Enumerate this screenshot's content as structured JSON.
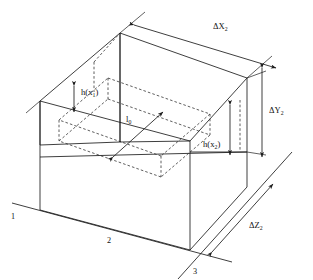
{
  "figure": {
    "type": "engineering-isometric-diagram",
    "colors": {
      "line": "#1c1c1c",
      "dashed_line": "#2a2a2a",
      "background": "#ffffff",
      "text": "#111111"
    },
    "dimension_labels": [
      {
        "id": "delta-x2",
        "base": "ΔX",
        "subscript": "2",
        "text": "ΔX₂",
        "orientation": "top-edge-horizontal-oblique",
        "arrow_style": "double-headed",
        "position": {
          "x": 224,
          "y": 28
        }
      },
      {
        "id": "delta-y2",
        "base": "ΔY",
        "subscript": "2",
        "text": "ΔY₂",
        "orientation": "right-edge-vertical",
        "arrow_style": "double-headed",
        "position": {
          "x": 277,
          "y": 110
        }
      },
      {
        "id": "delta-z2",
        "base": "ΔZ",
        "subscript": "2",
        "text": "ΔZ₂",
        "orientation": "bottom-right-edge-oblique",
        "arrow_style": "double-headed",
        "position": {
          "x": 258,
          "y": 225
        }
      }
    ],
    "height_labels": [
      {
        "id": "h-x1",
        "base": "h(x",
        "subscript": "1",
        "suffix": ")",
        "text": "h(x₁)",
        "orientation": "vertical",
        "arrow_style": "double-headed",
        "position": {
          "x": 78,
          "y": 93
        }
      },
      {
        "id": "h-x2",
        "base": "h(x",
        "subscript": "2",
        "suffix": ")",
        "text": "h(x₂)",
        "orientation": "vertical",
        "arrow_style": "double-headed",
        "position": {
          "x": 207,
          "y": 145
        }
      }
    ],
    "length_label": {
      "id": "l0",
      "base": "l",
      "subscript": "0",
      "text": "l₀",
      "orientation": "diagonal",
      "arrow_style": "double-headed",
      "position": {
        "x": 131,
        "y": 119
      }
    },
    "corner_labels": [
      {
        "id": "corner-1",
        "text": "1",
        "position": {
          "x": 14,
          "y": 216
        }
      },
      {
        "id": "corner-2",
        "text": "2",
        "position": {
          "x": 110,
          "y": 240
        }
      },
      {
        "id": "corner-3",
        "text": "3",
        "position": {
          "x": 196,
          "y": 271
        }
      }
    ]
  }
}
